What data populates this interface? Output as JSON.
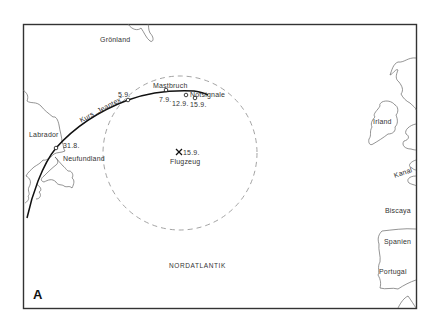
{
  "figure": {
    "panel_label": "A",
    "ocean_label": "NORDATLANTIK"
  },
  "regions": {
    "greenland": "Grönland",
    "labrador": "Labrador",
    "newfoundland": "Neufundland",
    "ireland": "Irland",
    "channel": "Kanal",
    "biscay": "Biscaya",
    "spain": "Spanien",
    "portugal": "Portugal"
  },
  "route": {
    "course_label": "Kurs „Jeantex“",
    "dates": {
      "d1": "31.8.",
      "d2": "5.9.",
      "d3": "7.9.",
      "d4": "12.9.",
      "d5": "15.9."
    },
    "events": {
      "dismasting": "Mastbruch",
      "distress": "Notsignale"
    }
  },
  "aircraft": {
    "date": "15.9.",
    "label": "Flugzeug",
    "marker": "x-mark-icon"
  },
  "colors": {
    "frame": "#333333",
    "coast": "#555555",
    "route": "#111111",
    "search_circle": "#999999"
  }
}
